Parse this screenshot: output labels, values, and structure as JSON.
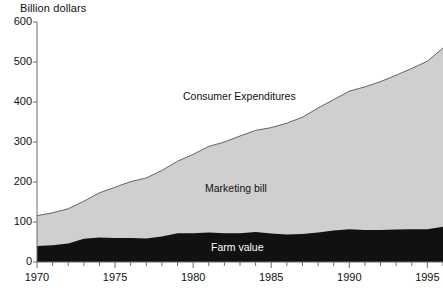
{
  "chart_data": {
    "type": "area",
    "stacked": true,
    "title": "",
    "subtitle": "",
    "xlabel": "",
    "ylabel": "Billion dollars",
    "ylim": [
      0,
      600
    ],
    "xlim": [
      1970,
      1996
    ],
    "grid": false,
    "legend_position": "inline-annotations",
    "y_ticks": [
      0,
      100,
      200,
      300,
      400,
      500,
      600
    ],
    "y_tick_labels": [
      "0",
      "100",
      "200",
      "300",
      "400",
      "500",
      "600"
    ],
    "x_ticks": [
      1970,
      1971,
      1972,
      1973,
      1974,
      1975,
      1976,
      1977,
      1978,
      1979,
      1980,
      1981,
      1982,
      1983,
      1984,
      1985,
      1986,
      1987,
      1988,
      1989,
      1990,
      1991,
      1992,
      1993,
      1994,
      1995,
      1996
    ],
    "x_tick_labels_major": [
      "1970",
      "1975",
      "1980",
      "1985",
      "1990",
      "1995"
    ],
    "x_major_ticks": [
      1970,
      1975,
      1980,
      1985,
      1990,
      1995
    ],
    "x": [
      1970,
      1971,
      1972,
      1973,
      1974,
      1975,
      1976,
      1977,
      1978,
      1979,
      1980,
      1981,
      1982,
      1983,
      1984,
      1985,
      1986,
      1987,
      1988,
      1989,
      1990,
      1991,
      1992,
      1993,
      1994,
      1995,
      1996
    ],
    "series": [
      {
        "name": "Farm value",
        "color": "#111111",
        "values": [
          40,
          42,
          46,
          58,
          61,
          60,
          60,
          59,
          64,
          72,
          72,
          74,
          72,
          72,
          75,
          71,
          69,
          70,
          74,
          79,
          82,
          80,
          80,
          81,
          82,
          82,
          88
        ]
      },
      {
        "name": "Marketing bill",
        "color": "#cfcfcf",
        "values": [
          76,
          81,
          87,
          94,
          112,
          127,
          141,
          151,
          165,
          180,
          197,
          215,
          228,
          243,
          254,
          265,
          278,
          292,
          311,
          327,
          345,
          358,
          371,
          386,
          402,
          420,
          447
        ]
      }
    ],
    "total_series": {
      "name": "Consumer Expenditures",
      "values": [
        116,
        123,
        133,
        152,
        173,
        187,
        201,
        210,
        229,
        252,
        269,
        289,
        300,
        315,
        329,
        336,
        347,
        362,
        385,
        406,
        427,
        438,
        451,
        467,
        484,
        502,
        535
      ]
    },
    "annotations": [
      {
        "text": "Consumer Expenditures",
        "x_px": 183,
        "y_px": 90,
        "on_dark": false
      },
      {
        "text": "Marketing bill",
        "x_px": 205,
        "y_px": 182,
        "on_dark": false
      },
      {
        "text": "Farm value",
        "x_px": 211,
        "y_px": 241,
        "on_dark": true
      }
    ]
  },
  "axis": {
    "y_title": "Billion dollars",
    "y_labels": [
      "600",
      "500",
      "400",
      "300",
      "200",
      "100",
      "0"
    ],
    "x_labels": [
      "1970",
      "1975",
      "1980",
      "1985",
      "1990",
      "1995"
    ]
  },
  "colors": {
    "farm_value": "#111111",
    "marketing_bill": "#cfcfcf",
    "axis": "#6b6b6b",
    "outline": "#555555",
    "background": "#ffffff",
    "text": "#111111",
    "text_on_dark": "#ffffff"
  },
  "labels": {
    "consumer_expenditures": "Consumer Expenditures",
    "marketing_bill": "Marketing bill",
    "farm_value": "Farm value"
  }
}
